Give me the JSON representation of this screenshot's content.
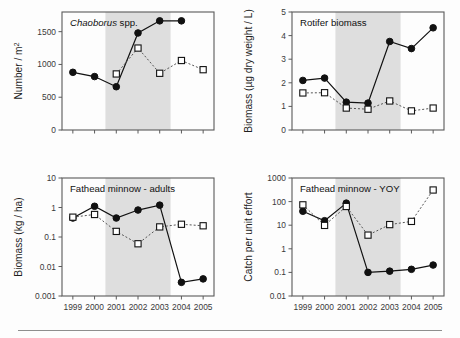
{
  "figure": {
    "name": "four-panel-time-series-figure",
    "background_color": "#fdfdfd",
    "shade_color": "#dedede",
    "series_colors": {
      "treatment": "#111111",
      "reference": "#555555"
    }
  },
  "chart_data": [
    {
      "type": "line",
      "panel": "top-left",
      "title": "Chaoborus spp.",
      "title_italic_part": "Chaoborus",
      "title_roman_part": " spp.",
      "xlabel": "",
      "ylabel": "Number / m",
      "ylabel_superscript": "2",
      "x": [
        1999,
        2000,
        2001,
        2002,
        2003,
        2004,
        2005
      ],
      "xticklabels": [
        "1999",
        "2000",
        "2001",
        "2002",
        "2003",
        "2004",
        "2005"
      ],
      "xlim": [
        1998.5,
        2005.5
      ],
      "ylim": [
        0,
        1800
      ],
      "yticks": [
        0,
        500,
        1000,
        1500
      ],
      "yticklabels": [
        "0",
        "500",
        "1000",
        "1500"
      ],
      "yscale": "linear",
      "grid": false,
      "shaded_span": [
        2000.5,
        2003.5
      ],
      "series": [
        {
          "name": "filled-circle-series",
          "marker": "filled-circle",
          "linestyle": "solid",
          "x": [
            1999,
            2000,
            2001,
            2002,
            2003,
            2004,
            2005
          ],
          "values": [
            880,
            815,
            660,
            1480,
            1665,
            1665,
            null
          ]
        },
        {
          "name": "open-square-series",
          "marker": "open-square",
          "linestyle": "dotted",
          "x": [
            2000,
            2001,
            2002,
            2003,
            2004,
            2005
          ],
          "values": [
            null,
            855,
            1250,
            865,
            1060,
            920
          ]
        }
      ]
    },
    {
      "type": "line",
      "panel": "top-right",
      "title": "Rotifer biomass",
      "xlabel": "",
      "ylabel": "Biomass (µg dry weight / L)",
      "x": [
        1999,
        2000,
        2001,
        2002,
        2003,
        2004,
        2005
      ],
      "xticklabels": [
        "1999",
        "2000",
        "2001",
        "2002",
        "2003",
        "2004",
        "2005"
      ],
      "xlim": [
        1998.5,
        2005.5
      ],
      "ylim": [
        0,
        5
      ],
      "yticks": [
        0,
        1,
        2,
        3,
        4,
        5
      ],
      "yticklabels": [
        "0",
        "1",
        "2",
        "3",
        "4",
        "5"
      ],
      "yscale": "linear",
      "grid": false,
      "shaded_span": [
        2000.5,
        2003.5
      ],
      "series": [
        {
          "name": "filled-circle-series",
          "marker": "filled-circle",
          "linestyle": "solid",
          "x": [
            1999,
            2000,
            2001,
            2002,
            2003,
            2004,
            2005
          ],
          "values": [
            2.1,
            2.2,
            1.18,
            1.14,
            3.75,
            3.45,
            4.33
          ]
        },
        {
          "name": "open-square-series",
          "marker": "open-square",
          "linestyle": "dotted",
          "x": [
            1999,
            2000,
            2001,
            2002,
            2003,
            2004,
            2005
          ],
          "values": [
            1.57,
            1.58,
            0.93,
            0.88,
            1.23,
            0.81,
            0.93
          ]
        }
      ]
    },
    {
      "type": "line",
      "panel": "bottom-left",
      "title": "Fathead minnow - adults",
      "xlabel": "",
      "ylabel": "Biomass (kg / ha)",
      "x": [
        1999,
        2000,
        2001,
        2002,
        2003,
        2004,
        2005
      ],
      "xticklabels": [
        "1999",
        "2000",
        "2001",
        "2002",
        "2003",
        "2004",
        "2005"
      ],
      "xlim": [
        1998.5,
        2005.5
      ],
      "ylim": [
        0.001,
        10
      ],
      "yticks": [
        0.001,
        0.01,
        0.1,
        1,
        10
      ],
      "yticklabels": [
        "0.001",
        "0.01",
        "0.1",
        "1",
        "10"
      ],
      "yscale": "log",
      "grid": false,
      "shaded_span": [
        2000.5,
        2003.5
      ],
      "series": [
        {
          "name": "filled-circle-series",
          "marker": "filled-circle",
          "linestyle": "solid",
          "x": [
            1999,
            2000,
            2001,
            2002,
            2003,
            2004,
            2005
          ],
          "values": [
            0.44,
            1.1,
            0.44,
            0.82,
            1.2,
            0.0029,
            0.0038
          ]
        },
        {
          "name": "open-square-series",
          "marker": "open-square",
          "linestyle": "dotted",
          "x": [
            1999,
            2000,
            2001,
            2002,
            2003,
            2004,
            2005
          ],
          "values": [
            0.47,
            0.58,
            0.155,
            0.059,
            0.22,
            0.27,
            0.24
          ]
        }
      ]
    },
    {
      "type": "line",
      "panel": "bottom-right",
      "title": "Fathead minnow - YOY",
      "xlabel": "",
      "ylabel": "Catch per unit effort",
      "x": [
        1999,
        2000,
        2001,
        2002,
        2003,
        2004,
        2005
      ],
      "xticklabels": [
        "1999",
        "2000",
        "2001",
        "2002",
        "2003",
        "2004",
        "2005"
      ],
      "xlim": [
        1998.5,
        2005.5
      ],
      "ylim": [
        0.01,
        1000
      ],
      "yticks": [
        0.01,
        0.1,
        1,
        10,
        100,
        1000
      ],
      "yticklabels": [
        "0.01",
        "0.1",
        "1",
        "10",
        "100",
        "1000"
      ],
      "yscale": "log",
      "grid": false,
      "shaded_span": [
        2000.5,
        2003.5
      ],
      "series": [
        {
          "name": "filled-circle-series",
          "marker": "filled-circle",
          "linestyle": "solid",
          "x": [
            1999,
            2000,
            2001,
            2002,
            2003,
            2004,
            2005
          ],
          "values": [
            39,
            15.5,
            86,
            0.1,
            0.113,
            0.135,
            0.205
          ]
        },
        {
          "name": "open-square-series",
          "marker": "open-square",
          "linestyle": "dotted",
          "x": [
            1999,
            2000,
            2001,
            2002,
            2003,
            2004,
            2005
          ],
          "values": [
            73,
            9.8,
            62,
            3.8,
            10.6,
            14.5,
            310
          ]
        }
      ]
    }
  ]
}
